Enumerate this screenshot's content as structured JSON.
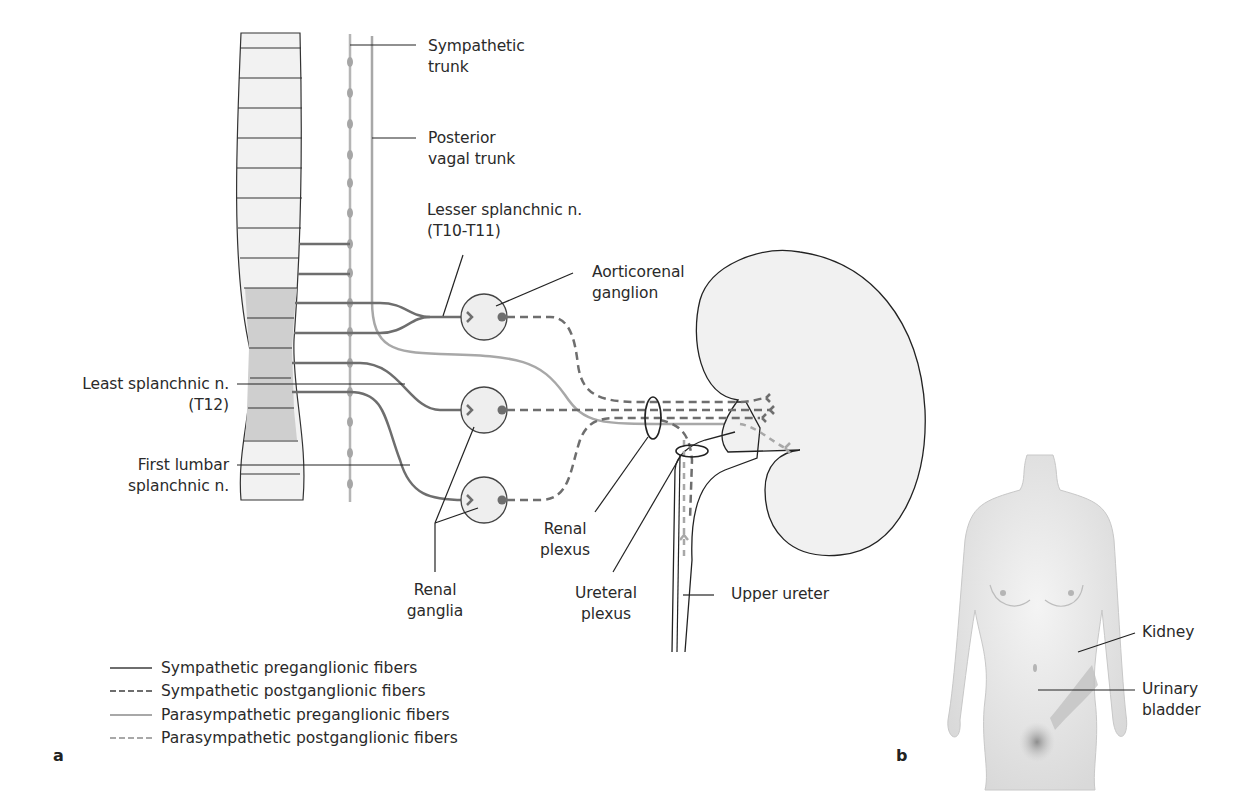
{
  "figure": {
    "panel_a": "a",
    "panel_b": "b",
    "colors": {
      "sympathetic_pre": "#6e6e6e",
      "sympathetic_post": "#6e6e6e",
      "parasympathetic_pre": "#a8a8a8",
      "parasympathetic_post": "#a8a8a8",
      "tissue_fill": "#f1f1f1",
      "spinal_highlight": "#cfcfcf",
      "outline": "#222222"
    }
  },
  "labels": {
    "sympathetic_trunk": [
      "Sympathetic",
      "trunk"
    ],
    "posterior_vagal_trunk": [
      "Posterior",
      "vagal trunk"
    ],
    "lesser_splanchnic": [
      "Lesser splanchnic n.",
      "(T10-T11)"
    ],
    "aorticorenal_ganglion": [
      "Aorticorenal",
      "ganglion"
    ],
    "least_splanchnic": [
      "Least splanchnic n.",
      "(T12)"
    ],
    "first_lumbar_splanchnic": [
      "First lumbar",
      "splanchnic n."
    ],
    "renal_ganglia": [
      "Renal",
      "ganglia"
    ],
    "renal_plexus": [
      "Renal",
      "plexus"
    ],
    "ureteral_plexus": [
      "Ureteral",
      "plexus"
    ],
    "upper_ureter": "Upper ureter",
    "kidney": "Kidney",
    "urinary_bladder": [
      "Urinary",
      "bladder"
    ]
  },
  "legend": [
    {
      "label": "Sympathetic preganglionic fibers",
      "style": "solid",
      "color": "#6e6e6e"
    },
    {
      "label": "Sympathetic postganglionic fibers",
      "style": "dashed",
      "color": "#6e6e6e"
    },
    {
      "label": "Parasympathetic preganglionic fibers",
      "style": "solid",
      "color": "#a8a8a8"
    },
    {
      "label": "Parasympathetic postganglionic fibers",
      "style": "dashed",
      "color": "#a8a8a8"
    }
  ]
}
